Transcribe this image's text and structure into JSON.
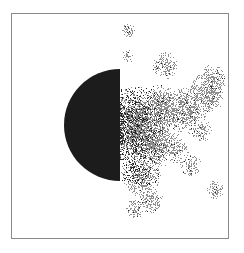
{
  "figure": {
    "frame": {
      "x": 11,
      "y": 13,
      "width": 218,
      "height": 226,
      "color": "#8a8a8a"
    },
    "half_disk": {
      "cx": 120,
      "cy": 125,
      "r": 56,
      "side": "left",
      "color": "#1c1c1c"
    },
    "cluster": {
      "x_min": 120,
      "x_max": 229,
      "y_min": 20,
      "y_max": 222,
      "colors": {
        "gray": "#8e8e8e",
        "dark": "#262626"
      },
      "seed": 7
    }
  }
}
